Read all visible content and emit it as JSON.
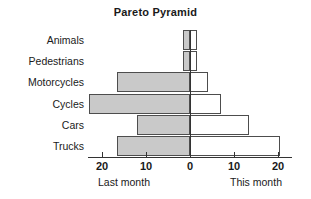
{
  "chart": {
    "title": "Pareto Pyramid",
    "left_caption": "Last month",
    "right_caption": "This month"
  },
  "chart_data": {
    "type": "bar",
    "orientation": "horizontal-diverging",
    "title": "Pareto Pyramid",
    "xlabel": "",
    "ylabel": "",
    "categories": [
      "Animals",
      "Pedestrians",
      "Motorcycles",
      "Cycles",
      "Cars",
      "Trucks"
    ],
    "series": [
      {
        "name": "Last month",
        "direction": "left",
        "values": [
          1.5,
          1.5,
          16.5,
          23,
          12,
          16.5
        ]
      },
      {
        "name": "This month",
        "direction": "right",
        "values": [
          1.5,
          1.5,
          4,
          7,
          13.5,
          20.5
        ]
      }
    ],
    "xticks": [
      20,
      10,
      0,
      10,
      20
    ],
    "xtick_labels": [
      "20",
      "10",
      "0",
      "10",
      "20"
    ],
    "xlim": [
      -23,
      23
    ],
    "grid": false,
    "legend": "none",
    "colors": {
      "left_fill": "#c9c9c9",
      "right_fill": "#ffffff",
      "outline": "#4d4d4d",
      "axis": "#333333"
    }
  }
}
